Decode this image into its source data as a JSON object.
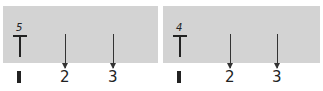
{
  "panels": [
    {
      "superscript": "5",
      "symbol": "T",
      "arrows": [
        {
          "label": "2"
        },
        {
          "label": "3"
        }
      ],
      "bottom_mark": "I"
    },
    {
      "superscript": "4",
      "symbol": "T",
      "arrows": [
        {
          "label": "2"
        },
        {
          "label": "3"
        }
      ],
      "bottom_mark": "I"
    }
  ],
  "colors": {
    "panel_bg": "#d3d3d3",
    "ink": "#222222"
  }
}
